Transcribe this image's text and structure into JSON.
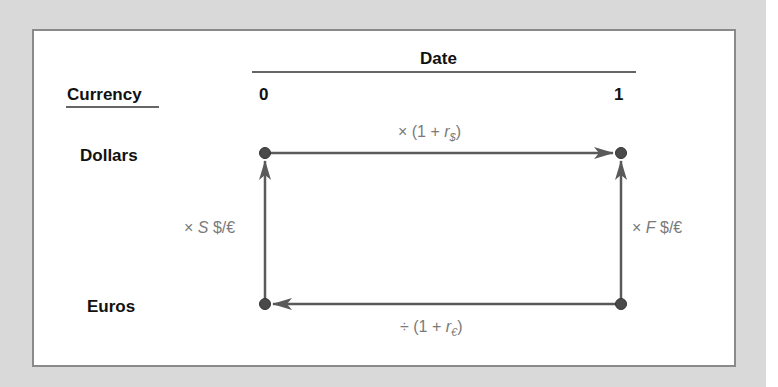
{
  "diagram": {
    "header": {
      "date_label": "Date",
      "currency_label": "Currency",
      "date_0": "0",
      "date_1": "1"
    },
    "rows": {
      "dollars": "Dollars",
      "euros": "Euros"
    },
    "edges": {
      "top": {
        "prefix": "× (1 + ",
        "var": "r",
        "sub": "$",
        "suffix": ")",
        "direction": "Dollars@0 → Dollars@1"
      },
      "bottom": {
        "prefix": "÷ (1 + ",
        "var": "r",
        "sub": "€",
        "suffix": ")",
        "direction": "Euros@1 → Euros@0"
      },
      "left": {
        "prefix": "× ",
        "var": "S",
        "suffix": " $/€",
        "direction": "Euros@0 → Dollars@0"
      },
      "right": {
        "prefix": "× ",
        "var": "F",
        "suffix": " $/€",
        "direction": "Euros@1 → Dollars@1"
      }
    },
    "colors": {
      "background": "#d9d9d9",
      "panel": "#ffffff",
      "border": "#8a8a8a",
      "line": "#5a5a5a",
      "node": "#4a4a4a",
      "math_text": "#7a7a7a"
    }
  }
}
